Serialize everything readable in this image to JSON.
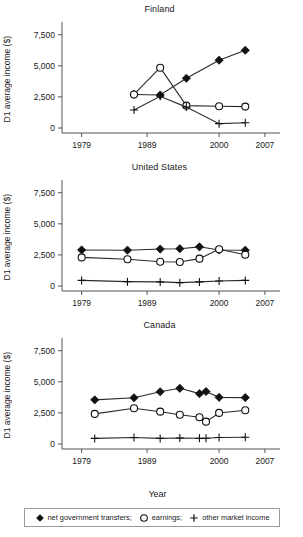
{
  "figure": {
    "xlabel": "Year",
    "ylabel": "D1 average income ($)"
  },
  "legend": {
    "items": [
      {
        "label": "net government transfers;",
        "marker": "diamond-marker-icon"
      },
      {
        "label": "earnings;",
        "marker": "circle-marker-icon"
      },
      {
        "label": "other market income",
        "marker": "plus-marker-icon"
      }
    ]
  },
  "axes": {
    "yticks": [
      0,
      2500,
      5000,
      7500
    ],
    "ytick_labels": [
      "0",
      "2,500",
      "5,000",
      "7,500"
    ],
    "xticks": [
      1979,
      1989,
      2000,
      2007
    ],
    "xtick_labels": [
      "1979",
      "1989",
      "2000",
      "2007"
    ],
    "xlim": [
      1976,
      2009
    ],
    "ylim": [
      -400,
      8200
    ]
  },
  "chart_data": [
    {
      "type": "line",
      "title": "Finland",
      "xlabel": "Year",
      "ylabel": "D1 average income ($)",
      "xlim": [
        1976,
        2009
      ],
      "ylim": [
        -400,
        8200
      ],
      "grid": false,
      "legend_position": "bottom",
      "x": [
        1987,
        1991,
        1995,
        2000,
        2004
      ],
      "series": [
        {
          "name": "net government transfers",
          "marker": "diamond",
          "values": [
            2700,
            2650,
            4000,
            5450,
            6250
          ]
        },
        {
          "name": "earnings",
          "marker": "circle",
          "values": [
            2700,
            4850,
            1800,
            1750,
            1720
          ]
        },
        {
          "name": "other market income",
          "marker": "plus",
          "values": [
            1450,
            2550,
            1680,
            350,
            420
          ]
        }
      ]
    },
    {
      "type": "line",
      "title": "United States",
      "xlabel": "Year",
      "ylabel": "D1 average income ($)",
      "xlim": [
        1976,
        2009
      ],
      "ylim": [
        -400,
        8200
      ],
      "grid": false,
      "legend_position": "bottom",
      "x": [
        1979,
        1986,
        1991,
        1994,
        1997,
        2000,
        2004
      ],
      "series": [
        {
          "name": "net government transfers",
          "marker": "diamond",
          "values": [
            2900,
            2880,
            2970,
            3000,
            3150,
            2900,
            2880
          ]
        },
        {
          "name": "earnings",
          "marker": "circle",
          "values": [
            2300,
            2150,
            1950,
            1930,
            2200,
            2950,
            2520
          ]
        },
        {
          "name": "other market income",
          "marker": "plus",
          "values": [
            450,
            350,
            330,
            270,
            330,
            400,
            450
          ]
        }
      ]
    },
    {
      "type": "line",
      "title": "Canada",
      "xlabel": "Year",
      "ylabel": "D1 average income ($)",
      "xlim": [
        1976,
        2009
      ],
      "ylim": [
        -400,
        8200
      ],
      "grid": false,
      "legend_position": "bottom",
      "x": [
        1981,
        1987,
        1991,
        1994,
        1997,
        1998,
        2000,
        2004
      ],
      "series": [
        {
          "name": "net government transfers",
          "marker": "diamond",
          "values": [
            3550,
            3720,
            4200,
            4480,
            4050,
            4220,
            3750,
            3730
          ]
        },
        {
          "name": "earnings",
          "marker": "circle",
          "values": [
            2420,
            2880,
            2600,
            2350,
            2150,
            1800,
            2500,
            2720
          ]
        },
        {
          "name": "other market income",
          "marker": "plus",
          "values": [
            450,
            520,
            450,
            480,
            470,
            470,
            520,
            550
          ]
        }
      ]
    }
  ]
}
